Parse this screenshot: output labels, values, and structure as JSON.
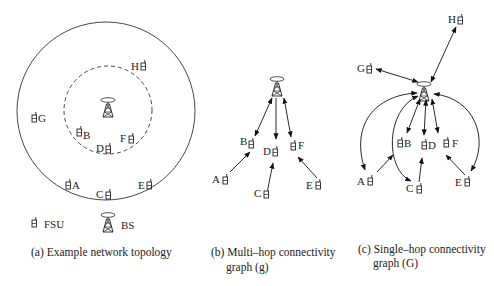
{
  "panels": {
    "a": {
      "caption": "(a) Example network topology",
      "legend": {
        "fsu_label": "FSU",
        "bs_label": "BS"
      },
      "nodes": [
        {
          "id": "H",
          "x": 145,
          "y": 64,
          "label_side": "left"
        },
        {
          "id": "G",
          "x": 33,
          "y": 118,
          "label_side": "right"
        },
        {
          "id": "B",
          "x": 79,
          "y": 133,
          "label_side": "right"
        },
        {
          "id": "F",
          "x": 133,
          "y": 137,
          "label_side": "left"
        },
        {
          "id": "D",
          "x": 110,
          "y": 147,
          "label_side": "left"
        },
        {
          "id": "A",
          "x": 69,
          "y": 184,
          "label_side": "right"
        },
        {
          "id": "C",
          "x": 109,
          "y": 194,
          "label_side": "left"
        },
        {
          "id": "E",
          "x": 150,
          "y": 183,
          "label_side": "left"
        }
      ]
    },
    "b": {
      "caption_line1": "(b) Multi–hop connectivity",
      "caption_line2": "graph (g)",
      "nodes": [
        {
          "id": "B",
          "label_side": "left"
        },
        {
          "id": "D",
          "label_side": "left"
        },
        {
          "id": "F",
          "label_side": "right"
        },
        {
          "id": "A",
          "label_side": "left"
        },
        {
          "id": "C",
          "label_side": "left"
        },
        {
          "id": "E",
          "label_side": "left"
        }
      ]
    },
    "c": {
      "caption_line1": "(c) Single–hop connectivity",
      "caption_line2": "graph (G)",
      "nodes": [
        {
          "id": "H",
          "label_side": "left"
        },
        {
          "id": "G",
          "label_side": "left"
        },
        {
          "id": "B",
          "label_side": "right"
        },
        {
          "id": "D",
          "label_side": "right"
        },
        {
          "id": "F",
          "label_side": "right"
        },
        {
          "id": "A",
          "label_side": "left"
        },
        {
          "id": "C",
          "label_side": "left"
        },
        {
          "id": "E",
          "label_side": "left"
        }
      ]
    }
  },
  "icons": {
    "fsu": "handset-icon",
    "bs": "base-station-tower-icon"
  }
}
